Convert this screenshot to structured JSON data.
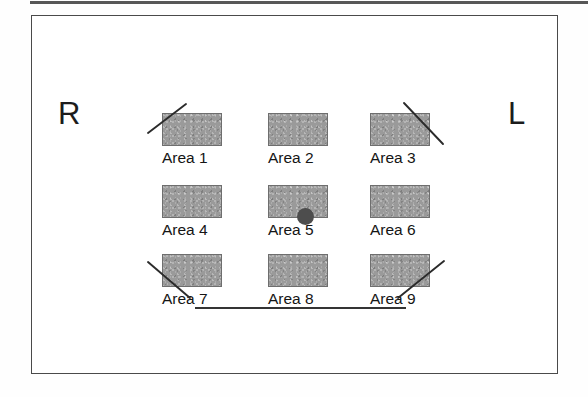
{
  "figure": {
    "side_labels": {
      "left": "R",
      "right": "L"
    },
    "colors": {
      "area_fill": "#9a9a9a",
      "area_border": "#6e6e6e",
      "box_border": "#4a4a4a",
      "marker_dot": "#4d4d4d",
      "ink": "#1a1a1a",
      "background": "#ffffff"
    },
    "areas": [
      {
        "label": "Area 1",
        "row": 1,
        "col": 1,
        "marked": true,
        "mark": "slash-through-top-left-corner",
        "dot": false
      },
      {
        "label": "Area 2",
        "row": 1,
        "col": 2,
        "marked": false,
        "mark": "none",
        "dot": false
      },
      {
        "label": "Area 3",
        "row": 1,
        "col": 3,
        "marked": true,
        "mark": "slash-through-top-right-corner",
        "dot": false
      },
      {
        "label": "Area 4",
        "row": 2,
        "col": 1,
        "marked": false,
        "mark": "none",
        "dot": false
      },
      {
        "label": "Area 5",
        "row": 2,
        "col": 2,
        "marked": false,
        "mark": "none",
        "dot": true
      },
      {
        "label": "Area 6",
        "row": 2,
        "col": 3,
        "marked": false,
        "mark": "none",
        "dot": false
      },
      {
        "label": "Area 7",
        "row": 3,
        "col": 1,
        "marked": true,
        "mark": "slash-through-bottom-left-corner",
        "dot": false
      },
      {
        "label": "Area 8",
        "row": 3,
        "col": 2,
        "marked": false,
        "mark": "none",
        "dot": false
      },
      {
        "label": "Area 9",
        "row": 3,
        "col": 3,
        "marked": true,
        "mark": "slash-through-bottom-right-corner",
        "dot": false
      }
    ],
    "annotations": {
      "marker_dot_location": "Area 5",
      "underline_below_bottom_row": true,
      "top_page_rule": true
    }
  }
}
